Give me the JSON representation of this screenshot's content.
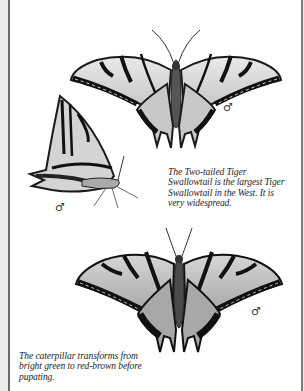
{
  "page": {
    "type": "field-guide-page",
    "background": "#ffffff",
    "ink_color": "#1e1e1e"
  },
  "illustrations": [
    {
      "id": "dorsal-view-top",
      "subject": "Two-tailed Tiger Swallowtail, upperside, wings spread",
      "sex_symbol": "♂"
    },
    {
      "id": "side-view",
      "subject": "Two-tailed Tiger Swallowtail, side view, wings closed",
      "sex_symbol": "♂"
    },
    {
      "id": "dorsal-view-bottom",
      "subject": "Two-tailed Tiger Swallowtail, upperside, wings spread",
      "sex_symbol": "♂"
    }
  ],
  "captions": {
    "species_note": {
      "lines": [
        "The Two-tailed Tiger",
        "Swallowtail is the largest Tiger",
        "Swallowtail in the West. It is",
        "very widespread."
      ]
    },
    "caterpillar_note": {
      "lines": [
        "The caterpillar transforms from",
        "bright green to red-brown before",
        "pupating."
      ]
    }
  }
}
